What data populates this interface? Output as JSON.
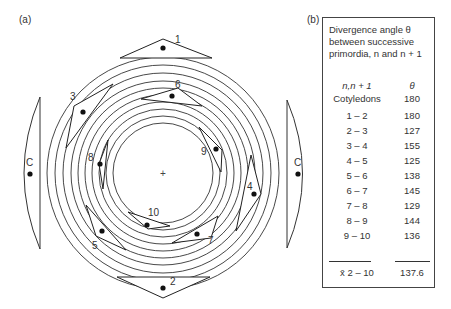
{
  "panels": {
    "a_label": "(a)",
    "b_label": "(b)"
  },
  "diagram": {
    "center_mark": "+",
    "ring_count": 10,
    "cotyledon_label": "C",
    "primordia_labels": [
      "1",
      "2",
      "3",
      "4",
      "5",
      "6",
      "7",
      "8",
      "9",
      "10"
    ]
  },
  "table": {
    "caption_line1": "Divergence angle θ",
    "caption_line2": "between successive",
    "caption_line3": "primordia, n and n + 1",
    "col1_header": "n,n + 1",
    "col2_header": "θ",
    "rows": [
      {
        "pair": "Cotyledons",
        "angle": "180"
      },
      {
        "pair": "1 – 2",
        "angle": "180"
      },
      {
        "pair": "2 – 3",
        "angle": "127"
      },
      {
        "pair": "3 – 4",
        "angle": "155"
      },
      {
        "pair": "4 – 5",
        "angle": "125"
      },
      {
        "pair": "5 – 6",
        "angle": "138"
      },
      {
        "pair": "6 – 7",
        "angle": "145"
      },
      {
        "pair": "7 – 8",
        "angle": "129"
      },
      {
        "pair": "8 – 9",
        "angle": "144"
      },
      {
        "pair": "9 – 10",
        "angle": "136"
      }
    ],
    "mean_label": "x̄ 2 – 10",
    "mean_value": "137.6"
  }
}
